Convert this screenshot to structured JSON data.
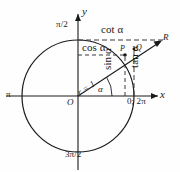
{
  "figure": {
    "type": "unit-circle-trigonometry-diagram",
    "colors": {
      "stroke": "#1a1a1a",
      "dashed": "#3a3a3a",
      "background": "#fefefe"
    },
    "geometry": {
      "center_label": "O",
      "center_px": [
        78,
        96
      ],
      "radius_px": 56,
      "angle_deg": 33,
      "tangent_line_x_px": 134
    },
    "axes": {
      "x_label": "x",
      "y_label": "y",
      "origin_label": "O"
    },
    "angle_markers": {
      "right": "0; 2π",
      "top": "π/2",
      "left": "π",
      "bottom": "3π/2"
    },
    "points": {
      "p": "P",
      "q": "Q",
      "r": "R"
    },
    "segments": {
      "radius": "r = 1",
      "angle": "α",
      "sine": "sin α",
      "cosine": "cos α",
      "tangent": "tan α",
      "cotangent": "cot α"
    }
  }
}
